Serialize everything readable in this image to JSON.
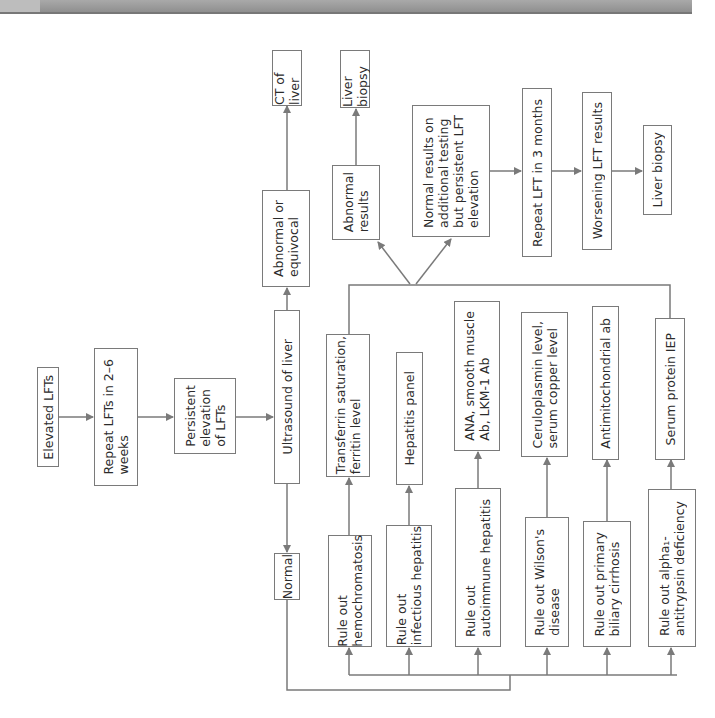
{
  "flowchart": {
    "orientation": "rotated 90° counter-clockwise (text reads bottom-to-top)",
    "nodes": {
      "elevated_lfts": "Elevated LFTs",
      "repeat_lfts": "Repeat LFTs in 2–6\nweeks",
      "persistent": "Persistent\nelevation\nof LFTs",
      "ultrasound": "Ultrasound of liver",
      "abnormal_equivocal": "Abnormal or\nequivocal",
      "ct_liver": "CT of liver",
      "normal": "Normal",
      "ro_hemochromatosis": "Rule out\nhemochromatosis",
      "ro_infectious": "Rule out\ninfectious hepatitis",
      "ro_autoimmune": "Rule out\nautoimmune hepatitis",
      "ro_wilson": "Rule out Wilson's\ndisease",
      "ro_pbc": "Rule out primary\nbiliary cirrhosis",
      "ro_alpha1": "Rule out alpha₁-\nantitrypsin deficiency",
      "test_transferrin": "Transferrin saturation,\nferritin level",
      "test_hepatitis": "Hepatitis panel",
      "test_ana": "ANA, smooth muscle\nAb, LKM-1 Ab",
      "test_ceruloplasmin": "Ceruloplasmin level,\nserum copper level",
      "test_antimito": "Antimitochondrial ab",
      "test_serum_protein": "Serum protein IEP",
      "abnormal_results": "Abnormal\nresults",
      "liver_biopsy_1": "Liver biopsy",
      "normal_results": "Normal results on\nadditional testing\nbut persistent LFT\nelevation",
      "repeat_lft_3mo": "Repeat LFT in 3 months",
      "worsening": "Worsening LFT results",
      "liver_biopsy_2": "Liver biopsy"
    },
    "edges": [
      [
        "elevated_lfts",
        "repeat_lfts"
      ],
      [
        "repeat_lfts",
        "persistent"
      ],
      [
        "persistent",
        "ultrasound"
      ],
      [
        "ultrasound",
        "abnormal_equivocal"
      ],
      [
        "abnormal_equivocal",
        "ct_liver"
      ],
      [
        "ultrasound",
        "normal"
      ],
      [
        "normal",
        "ro_hemochromatosis"
      ],
      [
        "normal",
        "ro_infectious"
      ],
      [
        "normal",
        "ro_autoimmune"
      ],
      [
        "normal",
        "ro_wilson"
      ],
      [
        "normal",
        "ro_pbc"
      ],
      [
        "normal",
        "ro_alpha1"
      ],
      [
        "ro_hemochromatosis",
        "test_transferrin"
      ],
      [
        "ro_infectious",
        "test_hepatitis"
      ],
      [
        "ro_autoimmune",
        "test_ana"
      ],
      [
        "ro_wilson",
        "test_ceruloplasmin"
      ],
      [
        "ro_pbc",
        "test_antimito"
      ],
      [
        "ro_alpha1",
        "test_serum_protein"
      ],
      [
        "tests",
        "abnormal_results"
      ],
      [
        "abnormal_results",
        "liver_biopsy_1"
      ],
      [
        "tests",
        "normal_results"
      ],
      [
        "normal_results",
        "repeat_lft_3mo"
      ],
      [
        "repeat_lft_3mo",
        "worsening"
      ],
      [
        "worsening",
        "liver_biopsy_2"
      ]
    ]
  },
  "colors": {
    "line": "#7a7a7a",
    "text": "#2b2b2b",
    "header_bar": "#9a9a9a"
  }
}
